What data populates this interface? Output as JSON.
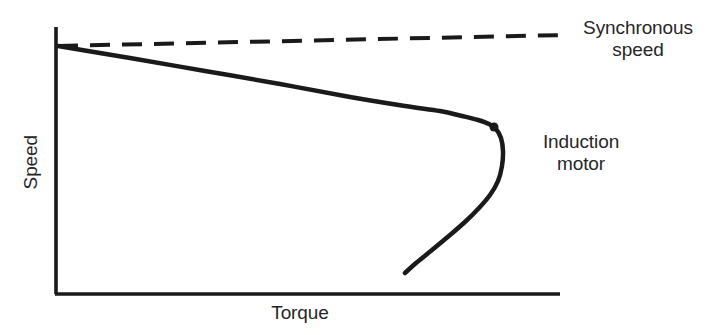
{
  "figure": {
    "background_color": "#ffffff",
    "ink_color": "#1a1a1a",
    "text_color": "#262626"
  },
  "axes": {
    "y_axis_label": "Speed",
    "x_axis_label": "Torque",
    "x_axis": {
      "x_start": 56,
      "x_end": 560,
      "y": 294
    },
    "y_axis": {
      "x": 56,
      "y_start": 27,
      "y_end": 294
    },
    "ticks": [],
    "gridlines": false
  },
  "annotations": {
    "synchronous_speed": "Synchronous\nspeed",
    "induction_motor": "Induction\nmotor",
    "marker": {
      "name": "breakdown-torque-point",
      "x": 494,
      "y": 127,
      "radius": 4.5
    }
  },
  "chart_data": {
    "type": "line",
    "title": "",
    "subtitle": "",
    "xlabel": "Torque",
    "ylabel": "Speed",
    "xlim": [
      0,
      1
    ],
    "ylim": [
      0,
      1
    ],
    "grid": false,
    "legend_position": "inline-annotation",
    "axis_tick_labels": {
      "x": [],
      "y": []
    },
    "series": [
      {
        "name": "Synchronous speed",
        "style": "dashed",
        "color": "#1a1a1a",
        "width": 4,
        "dash_pattern": [
          20,
          12
        ],
        "annotation": "Synchronous\nspeed",
        "points_px": [
          [
            58,
            46
          ],
          [
            565,
            35
          ]
        ],
        "x": [
          0.0,
          1.0
        ],
        "y": [
          1.0,
          1.0
        ]
      },
      {
        "name": "Induction motor",
        "style": "solid",
        "color": "#1a1a1a",
        "width": 4.5,
        "annotation": "Induction\nmotor",
        "points_px": [
          [
            58,
            46
          ],
          [
            130,
            58
          ],
          [
            205,
            71
          ],
          [
            280,
            84
          ],
          [
            350,
            97
          ],
          [
            405,
            106
          ],
          [
            440,
            111
          ],
          [
            462,
            116
          ],
          [
            478,
            120
          ],
          [
            489,
            124
          ],
          [
            496,
            129
          ],
          [
            501,
            138
          ],
          [
            503,
            151
          ],
          [
            502,
            166
          ],
          [
            498,
            181
          ],
          [
            490,
            195
          ],
          [
            479,
            208
          ],
          [
            466,
            221
          ],
          [
            450,
            235
          ],
          [
            432,
            250
          ],
          [
            416,
            263
          ],
          [
            405,
            273
          ]
        ],
        "x": [
          0.0,
          0.14,
          0.3,
          0.45,
          0.58,
          0.69,
          0.76,
          0.81,
          0.84,
          0.86,
          0.87,
          0.89,
          0.89,
          0.88,
          0.88,
          0.86,
          0.84,
          0.81,
          0.78,
          0.75,
          0.71,
          0.69
        ],
        "y": [
          1.0,
          0.95,
          0.91,
          0.86,
          0.81,
          0.78,
          0.76,
          0.74,
          0.73,
          0.72,
          0.7,
          0.67,
          0.62,
          0.57,
          0.51,
          0.46,
          0.41,
          0.36,
          0.31,
          0.25,
          0.2,
          0.16
        ]
      }
    ]
  }
}
